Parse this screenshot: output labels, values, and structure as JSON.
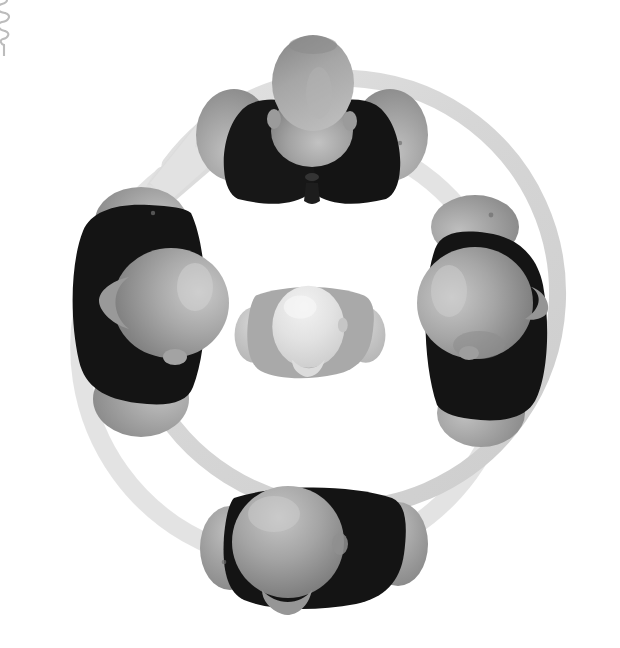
{
  "page": {
    "background_color": "#ffffff",
    "width": 620,
    "height": 648,
    "media": "scanned book page with spiral binding at top-left"
  },
  "binding": {
    "name": "spiral-binding-coil",
    "color": "#b9b9b9",
    "description": "partial spiral notebook coil visible at top-left corner"
  },
  "ring": {
    "name": "circular-rotation-arrow",
    "color": "#dcdcdc",
    "shadow_color": "#c6c6c6",
    "direction": "counter-clockwise",
    "center_x": 310,
    "center_y": 338,
    "radius": 215,
    "stroke_width": 17,
    "arrowhead_angle_deg": 146,
    "label": "rotation direction"
  },
  "palette": {
    "skin": "#9c9c9c",
    "skin_light": "#b8b8b8",
    "skin_shadow": "#7d7d7d",
    "garment": "#141414",
    "garment_light": "#262626",
    "ghost_skin": "#e3e3e3",
    "ghost_skin_shadow": "#cfcfcf",
    "ghost_garment": "#a9a9a9",
    "ghost_garment_light": "#b8b8b8",
    "outline": "#6e6e6e"
  },
  "figures": [
    {
      "id": "figure-top",
      "name": "figure-top-facing-down",
      "position_label": "top",
      "center_x": 312,
      "center_y": 122,
      "rotation_deg": 180,
      "scale": 1.0,
      "view": "overhead view of bald person in dark sleeveless top, facing toward viewer-bottom",
      "faded": false
    },
    {
      "id": "figure-left",
      "name": "figure-left-facing-right",
      "position_label": "left",
      "center_x": 143,
      "center_y": 316,
      "rotation_deg": 90,
      "scale": 1.0,
      "view": "overhead view, body turned so the face points right toward the centre",
      "faded": false
    },
    {
      "id": "figure-right",
      "name": "figure-right-facing-left",
      "position_label": "right",
      "center_x": 480,
      "center_y": 320,
      "rotation_deg": 270,
      "scale": 1.0,
      "view": "overhead view, body turned so the face points left toward the centre",
      "faded": false
    },
    {
      "id": "figure-bottom",
      "name": "figure-bottom-facing-up",
      "position_label": "bottom",
      "center_x": 315,
      "center_y": 545,
      "rotation_deg": 0,
      "scale": 1.0,
      "view": "overhead view of bald person in dark sleeveless top, facing away from viewer",
      "faded": false
    },
    {
      "id": "figure-center",
      "name": "figure-center-reference-ghost",
      "position_label": "center",
      "center_x": 310,
      "center_y": 330,
      "rotation_deg": 0,
      "scale": 0.82,
      "view": "faded reference figure at the centre of the rotation circle",
      "faded": true
    }
  ]
}
